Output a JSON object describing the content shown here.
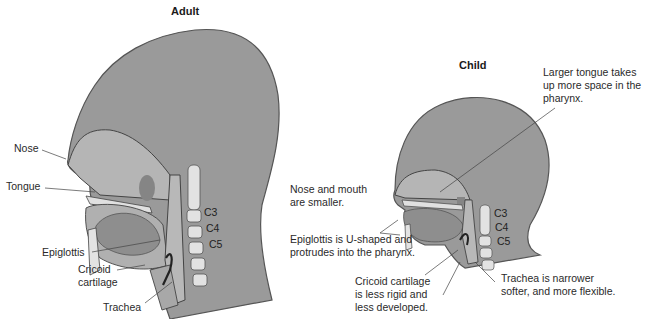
{
  "figure": {
    "adult": {
      "title": "Adult",
      "labels": {
        "nose": "Nose",
        "tongue": "Tongue",
        "epiglottis": "Epiglottis",
        "cricoid_line1": "Cricoid",
        "cricoid_line2": "cartilage",
        "trachea": "Trachea"
      },
      "vertebrae": [
        "C3",
        "C4",
        "C5"
      ]
    },
    "child": {
      "title": "Child",
      "labels": {
        "tongue_line1": "Larger tongue takes",
        "tongue_line2": "up more space in the",
        "tongue_line3": "pharynx.",
        "nose_line1": "Nose and mouth",
        "nose_line2": "are smaller.",
        "epiglottis_line1": "Epiglottis is U-shaped and",
        "epiglottis_line2": "protrudes into the pharynx.",
        "cricoid_line1": "Cricoid cartilage",
        "cricoid_line2": "is less rigid and",
        "cricoid_line3": "less developed.",
        "trachea_line1": "Trachea is narrower",
        "trachea_line2": "softer, and more flexible."
      },
      "vertebrae": [
        "C3",
        "C4",
        "C5"
      ]
    },
    "colors": {
      "head_fill": "#9a9a9a",
      "head_outline": "#555555",
      "airway_fill": "#b8b8b8",
      "tongue_fill": "#8a8a8a",
      "bone_fill": "#e2e2e2",
      "leader_line": "#444444"
    }
  }
}
